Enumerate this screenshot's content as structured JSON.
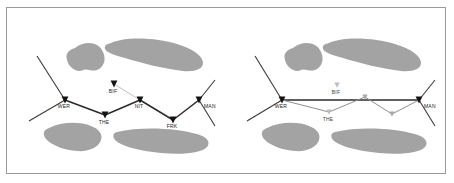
{
  "figure": {
    "top_cut_text": "· · · · · · · · · · · ·",
    "frame_border_color": "#9a9a9a",
    "background_color": "#ffffff",
    "blob_color": "#a3a3a3",
    "dark_marker_color": "#141414",
    "light_marker_color": "#bdbdbd"
  },
  "panels": [
    {
      "id": "left",
      "name": "left-panel",
      "nodes": [
        {
          "id": "WER",
          "label": "WER",
          "x": 58,
          "y": 92,
          "marker": "dark"
        },
        {
          "id": "THE",
          "label": "THE",
          "x": 98,
          "y": 107,
          "marker": "dark"
        },
        {
          "id": "NIT",
          "label": "NIT",
          "x": 133,
          "y": 92,
          "marker": "dark"
        },
        {
          "id": "FRK",
          "label": "FRK",
          "x": 166,
          "y": 112,
          "marker": "dark"
        },
        {
          "id": "MAN",
          "label": "MAN",
          "x": 192,
          "y": 92,
          "marker": "dark"
        },
        {
          "id": "BIF",
          "label": "BIF",
          "x": 107,
          "y": 76,
          "marker": "dark"
        }
      ],
      "main_path": [
        "WER",
        "THE",
        "NIT",
        "FRK",
        "MAN"
      ],
      "branch_links": [
        [
          "BIF",
          "NIT"
        ]
      ],
      "spur_lines": [
        {
          "from": [
            30,
            48
          ],
          "to": [
            58,
            92
          ]
        },
        {
          "from": [
            58,
            92
          ],
          "to": [
            22,
            113
          ]
        },
        {
          "from": [
            192,
            92
          ],
          "to": [
            208,
            72
          ]
        },
        {
          "from": [
            192,
            92
          ],
          "to": [
            208,
            118
          ]
        }
      ]
    },
    {
      "id": "right",
      "name": "right-panel",
      "nodes": [
        {
          "id": "WER",
          "label": "WER",
          "x": 275,
          "y": 92,
          "marker": "dark"
        },
        {
          "id": "THE",
          "label": "THE",
          "x": 322,
          "y": 104,
          "marker": "light"
        },
        {
          "id": "BIF",
          "label": "BIF",
          "x": 330,
          "y": 77,
          "marker": "light"
        },
        {
          "id": "MAN",
          "label": "MAN",
          "x": 412,
          "y": 92,
          "marker": "dark"
        },
        {
          "id": "P1",
          "label": "",
          "x": 358,
          "y": 89,
          "marker": "mid"
        },
        {
          "id": "P2",
          "label": "",
          "x": 385,
          "y": 106,
          "marker": "mid"
        }
      ],
      "main_path": [
        "WER",
        "MAN"
      ],
      "branch_links": [
        [
          "WER",
          "THE"
        ],
        [
          "THE",
          "P1"
        ],
        [
          "P1",
          "P2"
        ],
        [
          "P2",
          "MAN"
        ]
      ],
      "spur_lines": [
        {
          "from": [
            248,
            48
          ],
          "to": [
            275,
            92
          ]
        },
        {
          "from": [
            275,
            92
          ],
          "to": [
            240,
            113
          ]
        },
        {
          "from": [
            412,
            92
          ],
          "to": [
            428,
            72
          ]
        },
        {
          "from": [
            412,
            92
          ],
          "to": [
            428,
            118
          ]
        }
      ]
    }
  ],
  "blobs": {
    "left": [
      "M 68 40 C 78 32, 92 34, 96 44 C 100 52, 96 60, 90 62 C 84 64, 80 60, 76 62 C 70 65, 62 60, 60 52 C 58 45, 62 42, 68 40 Z",
      "M 104 35 C 120 28, 150 30, 170 36 C 186 41, 196 48, 196 55 C 196 61, 188 64, 176 63 C 158 61, 134 55, 118 50 C 108 47, 100 45, 98 41 C 97 37, 100 36, 104 35 Z",
      "M 42 120 C 56 113, 74 114, 84 118 C 92 121, 96 126, 94 132 C 92 139, 82 144, 70 143 C 58 142, 46 138, 40 132 C 35 127, 36 122, 42 120 Z",
      "M 110 124 C 134 118, 170 120, 190 126 C 200 129, 204 134, 200 139 C 195 145, 176 147, 154 145 C 132 143, 114 138, 108 132 C 105 128, 106 125, 110 124 Z"
    ],
    "right": [
      "M 286 40 C 296 32, 310 34, 314 44 C 318 52, 314 60, 308 62 C 302 64, 298 60, 294 62 C 288 65, 280 60, 278 52 C 276 45, 280 42, 286 40 Z",
      "M 322 35 C 338 28, 368 30, 388 36 C 404 41, 414 48, 414 55 C 414 61, 406 64, 394 63 C 376 61, 352 55, 336 50 C 326 47, 318 45, 316 41 C 315 37, 318 36, 322 35 Z",
      "M 260 120 C 274 113, 292 114, 302 118 C 310 121, 314 126, 312 132 C 310 139, 300 144, 288 143 C 276 142, 264 138, 258 132 C 253 127, 254 122, 260 120 Z",
      "M 328 124 C 352 118, 388 120, 408 126 C 418 129, 422 134, 418 139 C 413 145, 394 147, 372 145 C 350 143, 332 138, 326 132 C 323 128, 324 125, 328 124 Z"
    ]
  }
}
